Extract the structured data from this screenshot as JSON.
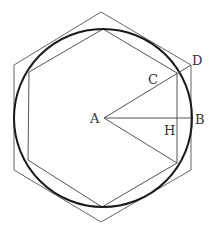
{
  "diagram": {
    "labels": {
      "A": "A",
      "B": "B",
      "C": "C",
      "D": "D",
      "H": "H"
    },
    "colors": {
      "background": "#ffffff",
      "circle": "#1a1a1a",
      "lines": "#555555",
      "text": "#333333"
    }
  }
}
